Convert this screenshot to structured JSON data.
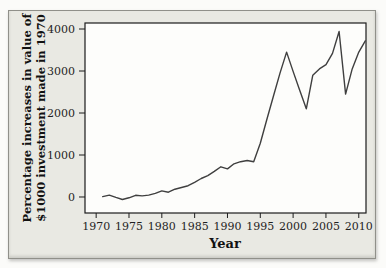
{
  "figure": {
    "panel_background": "#e9e9e3",
    "plot_background": "#fdfdfb",
    "frame_color": "#1c1c1c",
    "line_color": "#3f3f3f"
  },
  "chart_data": {
    "type": "line",
    "title": "",
    "xlabel": "Year",
    "ylabel": "Percentage increases in value of $1000 investment made in 1970",
    "ylabel_lines": [
      "Percentage increases in value of",
      "$1000 investment made in 1970"
    ],
    "x_ticks": [
      1970,
      1975,
      1980,
      1985,
      1990,
      1995,
      2000,
      2005,
      2010
    ],
    "y_ticks": [
      0,
      1000,
      2000,
      3000,
      4000
    ],
    "xlim": [
      1968.3,
      2011.1
    ],
    "ylim": [
      -381,
      4143
    ],
    "grid": false,
    "legend": false,
    "series": [
      {
        "name": "percentage-increase",
        "x": [
          1971,
          1972,
          1973,
          1974,
          1975,
          1976,
          1977,
          1978,
          1979,
          1980,
          1981,
          1982,
          1983,
          1984,
          1985,
          1986,
          1987,
          1988,
          1989,
          1990,
          1991,
          1992,
          1993,
          1994,
          1995,
          1996,
          1997,
          1998,
          1999,
          2000,
          2001,
          2002,
          2003,
          2004,
          2005,
          2006,
          2007,
          2008,
          2009,
          2010,
          2011
        ],
        "y": [
          10,
          45,
          -10,
          -60,
          -20,
          40,
          25,
          45,
          85,
          145,
          115,
          185,
          225,
          270,
          350,
          440,
          510,
          610,
          720,
          670,
          790,
          840,
          870,
          840,
          1280,
          1850,
          2400,
          2950,
          3450,
          2990,
          2540,
          2100,
          2900,
          3050,
          3150,
          3420,
          3940,
          2450,
          3050,
          3450,
          3720
        ]
      }
    ]
  }
}
